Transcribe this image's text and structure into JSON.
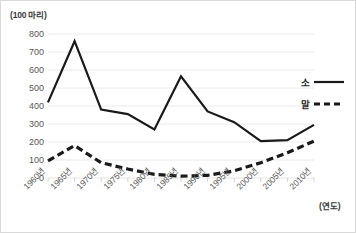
{
  "unit_label": "(100 마리)",
  "xaxis_title": "(연도)",
  "legend": {
    "items": [
      {
        "label": "소",
        "style": "solid"
      },
      {
        "label": "말",
        "style": "dashed"
      }
    ]
  },
  "chart_data": {
    "type": "line",
    "title": "",
    "subtitle": "",
    "xlabel": "(연도)",
    "ylabel": "(100 마리)",
    "categories": [
      "1960년",
      "1965년",
      "1970년",
      "1975년",
      "1980년",
      "1985년",
      "1990년",
      "1995년",
      "2000년",
      "2005년",
      "2010년"
    ],
    "x": [
      1960,
      1965,
      1970,
      1975,
      1980,
      1985,
      1990,
      1995,
      2000,
      2005,
      2010
    ],
    "series": [
      {
        "name": "소",
        "style": "solid",
        "color": "#1a1a1a",
        "values": [
          420,
          760,
          380,
          355,
          270,
          565,
          370,
          310,
          205,
          210,
          295
        ]
      },
      {
        "name": "말",
        "style": "dashed",
        "color": "#1a1a1a",
        "values": [
          95,
          180,
          85,
          50,
          20,
          10,
          15,
          40,
          85,
          140,
          205
        ]
      }
    ],
    "yticks": [
      0,
      100,
      200,
      300,
      400,
      500,
      600,
      700,
      800
    ],
    "ylim": [
      0,
      800
    ],
    "xlim": [
      1960,
      2010
    ],
    "grid": true,
    "grid_color": "#e4e4e4",
    "legend_position": "right"
  }
}
